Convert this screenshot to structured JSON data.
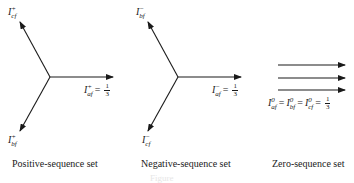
{
  "diagram": {
    "sets": [
      {
        "caption": "Positive-sequence set",
        "phasors": [
          {
            "name": "I",
            "sup": "+",
            "sub": "cf"
          },
          {
            "name": "I",
            "sup": "+",
            "sub": "af",
            "value_num": "1",
            "value_den": "3"
          },
          {
            "name": "I",
            "sup": "+",
            "sub": "bf"
          }
        ]
      },
      {
        "caption": "Negative-sequence set",
        "phasors": [
          {
            "name": "I",
            "sup": "−",
            "sub": "bf"
          },
          {
            "name": "I",
            "sup": "−",
            "sub": "af",
            "value_num": "1",
            "value_den": "3"
          },
          {
            "name": "I",
            "sup": "−",
            "sub": "cf"
          }
        ]
      },
      {
        "caption": "Zero-sequence set",
        "phasors": [
          {
            "name": "I",
            "sup": "0",
            "sub": "af"
          },
          {
            "name": "I",
            "sup": "0",
            "sub": "bf"
          },
          {
            "name": "I",
            "sup": "0",
            "sub": "cf",
            "value_num": "1",
            "value_den": "3"
          }
        ]
      }
    ],
    "eq_sign": "=",
    "figure_caption": "Figure"
  }
}
